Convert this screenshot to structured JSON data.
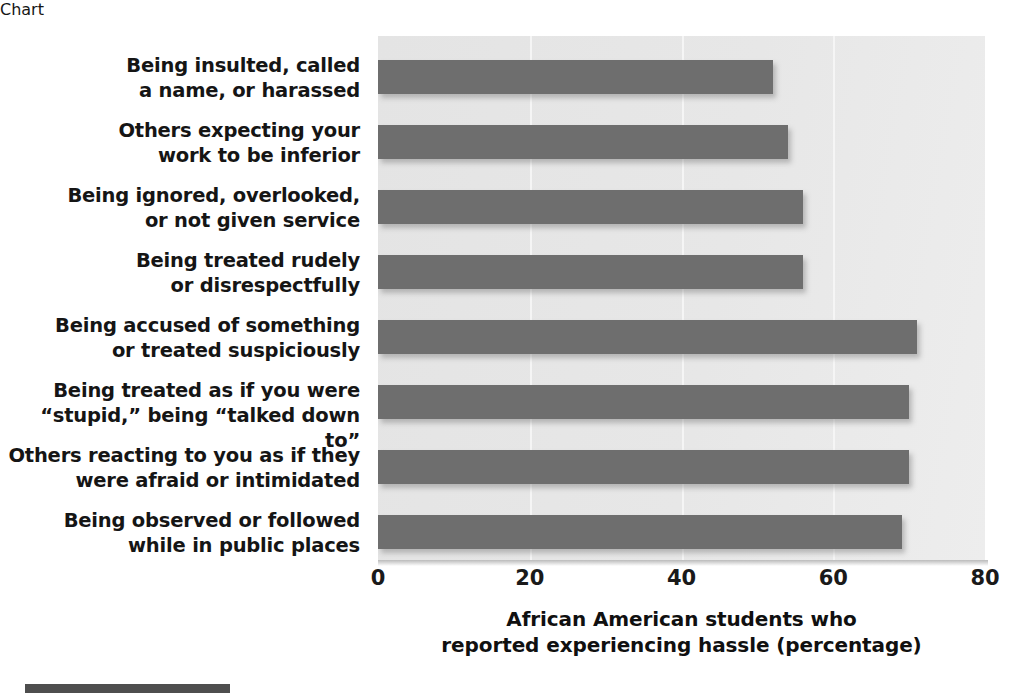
{
  "chart_data": {
    "type": "bar",
    "orientation": "horizontal",
    "title": "",
    "subtitle": "",
    "xlabel": "African American students who reported experiencing hassle (percentage)",
    "xlabel_lines": [
      "African American students who",
      "reported experiencing hassle (percentage)"
    ],
    "ylabel": "",
    "xlim": [
      0,
      80
    ],
    "xticks": [
      0,
      20,
      40,
      60,
      80
    ],
    "xtick_labels": [
      "0",
      "20",
      "40",
      "60",
      "80"
    ],
    "grid": "vertical-only",
    "legend": "none",
    "categories": [
      "Being insulted, called a name, or harassed",
      "Others expecting your work to be inferior",
      "Being ignored, overlooked, or not given service",
      "Being treated rudely or disrespectfully",
      "Being accused of something or treated suspiciously",
      "Being treated as if you were “stupid,” being “talked down to”",
      "Others reacting to you as if they were afraid or intimidated",
      "Being observed or followed while in public places"
    ],
    "category_lines": [
      [
        "Being insulted, called",
        "a name, or harassed"
      ],
      [
        "Others expecting your",
        "work to be inferior"
      ],
      [
        "Being ignored, overlooked,",
        "or not given service"
      ],
      [
        "Being treated rudely",
        "or disrespectfully"
      ],
      [
        "Being accused of something",
        "or treated suspiciously"
      ],
      [
        "Being treated as if you were",
        "“stupid,” being “talked down to”"
      ],
      [
        "Others reacting to you as if they",
        "were afraid or intimidated"
      ],
      [
        "Being observed or followed",
        "while in public places"
      ]
    ],
    "values": [
      52,
      54,
      56,
      56,
      71,
      70,
      70,
      69
    ],
    "bar_color": "#6e6e6e",
    "plot_background": "#e6e6e6",
    "gridline_color": "#f5f5f5",
    "page_background": "#ffffff"
  },
  "labels": {
    "cat_0_line_0": "Being insulted, called",
    "cat_0_line_1": "a name, or harassed",
    "cat_1_line_0": "Others expecting your",
    "cat_1_line_1": "work to be inferior",
    "cat_2_line_0": "Being ignored, overlooked,",
    "cat_2_line_1": "or not given service",
    "cat_3_line_0": "Being treated rudely",
    "cat_3_line_1": "or disrespectfully",
    "cat_4_line_0": "Being accused of something",
    "cat_4_line_1": "or treated suspiciously",
    "cat_5_line_0": "Being treated as if you were",
    "cat_5_line_1": "“stupid,” being “talked down to”",
    "cat_6_line_0": "Others reacting to you as if they",
    "cat_6_line_1": "were afraid or intimidated",
    "cat_7_line_0": "Being observed or followed",
    "cat_7_line_1": "while in public places"
  },
  "axis": {
    "tick_0": "0",
    "tick_1": "20",
    "tick_2": "40",
    "tick_3": "60",
    "tick_4": "80",
    "title_line_0": "African American students who",
    "title_line_1": "reported experiencing hassle (percentage)"
  }
}
